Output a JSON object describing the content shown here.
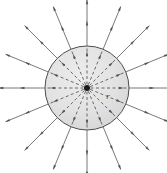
{
  "figure": {
    "background_color": "#ffffff",
    "sphere": {
      "label": "gaussian-sphere",
      "center_x": 87,
      "center_y": 88,
      "radius": 42,
      "fill_color": "#dedede",
      "fill_color_light": "#ececec",
      "stroke_color": "#4d4d4d",
      "stroke_width": 1
    },
    "charge": {
      "label": "point-charge",
      "center_x": 87,
      "center_y": 88,
      "radius": 3,
      "color": "#1a1a1a"
    },
    "radius_label": {
      "text": "r",
      "x": 108,
      "y": 99,
      "color": "#4a4a4a"
    },
    "field_lines": {
      "count": 16,
      "angle_step_degrees": 22.5,
      "start_angle_degrees": 0,
      "inner_style": "dashed",
      "inner_dash_pattern": "3,2.5",
      "outer_style": "solid",
      "inner_color": "#5a5a5a",
      "outer_color": "#6a6a6a",
      "stroke_width": 0.9,
      "outer_extent": 88,
      "arrow_positions": [
        0.5,
        0.96
      ],
      "arrow_direction": "outward",
      "arrow_color": "#555555",
      "arrow_length": 5,
      "arrow_width": 2.4
    }
  }
}
